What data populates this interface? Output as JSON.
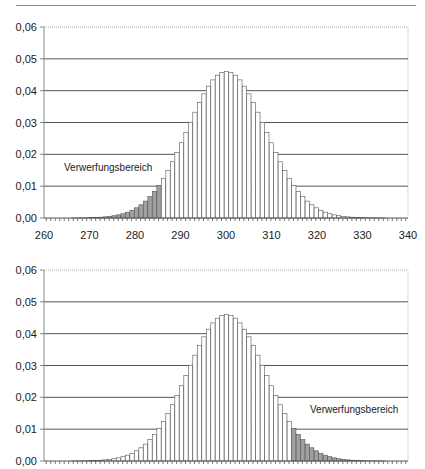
{
  "chart_data": [
    {
      "type": "bar",
      "title": "",
      "xlabel": "",
      "ylabel": "",
      "ylim": [
        0,
        0.06
      ],
      "xlim": [
        260,
        340
      ],
      "yticks": [
        "0,00",
        "0,01",
        "0,02",
        "0,03",
        "0,04",
        "0,05",
        "0,06"
      ],
      "xticks": [
        "260",
        "270",
        "280",
        "290",
        "300",
        "310",
        "320",
        "330",
        "340"
      ],
      "grid": "horizontal",
      "annotation": "Verwerfungsbereich",
      "shaded_range": [
        260,
        285
      ],
      "shade_side": "left",
      "x": [
        260,
        261,
        262,
        263,
        264,
        265,
        266,
        267,
        268,
        269,
        270,
        271,
        272,
        273,
        274,
        275,
        276,
        277,
        278,
        279,
        280,
        281,
        282,
        283,
        284,
        285,
        286,
        287,
        288,
        289,
        290,
        291,
        292,
        293,
        294,
        295,
        296,
        297,
        298,
        299,
        300,
        301,
        302,
        303,
        304,
        305,
        306,
        307,
        308,
        309,
        310,
        311,
        312,
        313,
        314,
        315,
        316,
        317,
        318,
        319,
        320,
        321,
        322,
        323,
        324,
        325,
        326,
        327,
        328,
        329,
        330,
        331,
        332,
        333,
        334,
        335,
        336,
        337,
        338,
        339,
        340
      ],
      "values": [
        0.0,
        0.0,
        0.0,
        0.0,
        0.0,
        0.0,
        2e-05,
        3e-05,
        5e-05,
        8e-05,
        0.00011,
        0.00017,
        0.00025,
        0.00036,
        0.00051,
        0.00071,
        0.00099,
        0.00135,
        0.00183,
        0.00243,
        0.0032,
        0.00415,
        0.00531,
        0.00672,
        0.00837,
        0.01028,
        0.01248,
        0.01497,
        0.01767,
        0.02057,
        0.02365,
        0.02685,
        0.03009,
        0.03324,
        0.03624,
        0.039,
        0.04141,
        0.04339,
        0.04486,
        0.04577,
        0.04607,
        0.04577,
        0.04486,
        0.04339,
        0.04141,
        0.039,
        0.03624,
        0.03324,
        0.03009,
        0.02685,
        0.02365,
        0.02057,
        0.01767,
        0.01497,
        0.01248,
        0.01028,
        0.00837,
        0.00672,
        0.00531,
        0.00415,
        0.0032,
        0.00243,
        0.00183,
        0.00135,
        0.00099,
        0.00071,
        0.00051,
        0.00036,
        0.00025,
        0.00017,
        0.00011,
        8e-05,
        5e-05,
        3e-05,
        2e-05,
        1e-05,
        0.0,
        0.0,
        0.0,
        0.0,
        0.0
      ]
    },
    {
      "type": "bar",
      "title": "",
      "xlabel": "",
      "ylabel": "",
      "ylim": [
        0,
        0.06
      ],
      "xlim": [
        260,
        340
      ],
      "yticks": [
        "0,00",
        "0,01",
        "0,02",
        "0,03",
        "0,04",
        "0,05",
        "0,06"
      ],
      "xticks": [],
      "grid": "horizontal",
      "annotation": "Verwerfungsbereich",
      "shaded_range": [
        315,
        340
      ],
      "shade_side": "right",
      "x": [
        260,
        261,
        262,
        263,
        264,
        265,
        266,
        267,
        268,
        269,
        270,
        271,
        272,
        273,
        274,
        275,
        276,
        277,
        278,
        279,
        280,
        281,
        282,
        283,
        284,
        285,
        286,
        287,
        288,
        289,
        290,
        291,
        292,
        293,
        294,
        295,
        296,
        297,
        298,
        299,
        300,
        301,
        302,
        303,
        304,
        305,
        306,
        307,
        308,
        309,
        310,
        311,
        312,
        313,
        314,
        315,
        316,
        317,
        318,
        319,
        320,
        321,
        322,
        323,
        324,
        325,
        326,
        327,
        328,
        329,
        330,
        331,
        332,
        333,
        334,
        335,
        336,
        337,
        338,
        339,
        340
      ],
      "values": [
        0.0,
        0.0,
        0.0,
        0.0,
        0.0,
        0.0,
        2e-05,
        3e-05,
        5e-05,
        8e-05,
        0.00011,
        0.00017,
        0.00025,
        0.00036,
        0.00051,
        0.00071,
        0.00099,
        0.00135,
        0.00183,
        0.00243,
        0.0032,
        0.00415,
        0.00531,
        0.00672,
        0.00837,
        0.01028,
        0.01248,
        0.01497,
        0.01767,
        0.02057,
        0.02365,
        0.02685,
        0.03009,
        0.03324,
        0.03624,
        0.039,
        0.04141,
        0.04339,
        0.04486,
        0.04577,
        0.04607,
        0.04577,
        0.04486,
        0.04339,
        0.04141,
        0.039,
        0.03624,
        0.03324,
        0.03009,
        0.02685,
        0.02365,
        0.02057,
        0.01767,
        0.01497,
        0.01248,
        0.01028,
        0.00837,
        0.00672,
        0.00531,
        0.00415,
        0.0032,
        0.00243,
        0.00183,
        0.00135,
        0.00099,
        0.00071,
        0.00051,
        0.00036,
        0.00025,
        0.00017,
        0.00011,
        8e-05,
        5e-05,
        3e-05,
        2e-05,
        1e-05,
        0.0,
        0.0,
        0.0,
        0.0,
        0.0
      ]
    }
  ],
  "colors": {
    "bar_fill": "#ffffff",
    "bar_stroke": "#555555",
    "shaded_fill": "#a0a0a0",
    "grid": "#555555",
    "axis": "#888888",
    "text": "#222222"
  }
}
